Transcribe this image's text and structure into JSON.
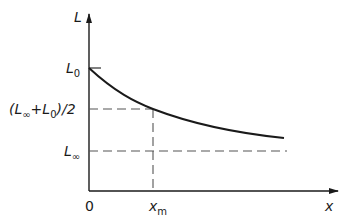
{
  "diagram": {
    "type": "decay-curve",
    "y_axis_label": "L",
    "x_axis_label": "x",
    "origin_label": "0",
    "y_ticks": [
      {
        "label": "L",
        "subscript": "0",
        "y": 68
      },
      {
        "label": "(L",
        "subscript": "∞",
        "mid": " + L",
        "subscript2": "0",
        "tail": ")/2",
        "y": 109
      },
      {
        "label": "L",
        "subscript": "∞",
        "y": 151
      }
    ],
    "x_ticks": [
      {
        "label": "x",
        "subscript": "m",
        "x": 153
      }
    ],
    "curve": "exponential decay from L0 toward L∞",
    "colors": {
      "line": "#1a1a1a",
      "dash": "#555555",
      "background": "#ffffff"
    }
  },
  "labels": {
    "L": "L",
    "x": "x",
    "zero": "0",
    "L0_main": "L",
    "L0_sub": "0",
    "Linf_main": "L",
    "Linf_sub": "∞",
    "half_open": "(L",
    "half_sub1": "∞",
    "half_plus": "+L",
    "half_sub2": "0",
    "half_close": ")/2",
    "xm_main": "x",
    "xm_sub": "m"
  }
}
